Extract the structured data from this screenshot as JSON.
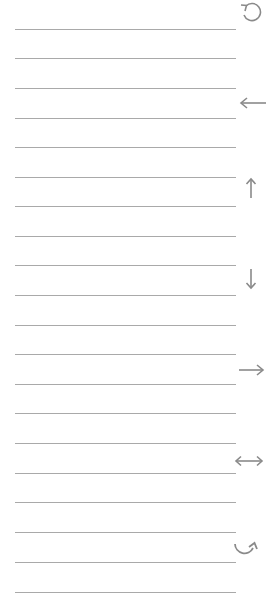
{
  "lines": {
    "count": 20,
    "color": "#a9a9a9",
    "positions_y": [
      29,
      58,
      88,
      118,
      147,
      177,
      206,
      236,
      265,
      295,
      325,
      354,
      384,
      413,
      443,
      473,
      502,
      532,
      562,
      592
    ]
  },
  "icons": [
    {
      "name": "rotate-counterclockwise-icon",
      "y": 1
    },
    {
      "name": "arrow-left-icon",
      "y": 92
    },
    {
      "name": "arrow-up-icon",
      "y": 177
    },
    {
      "name": "arrow-down-icon",
      "y": 268
    },
    {
      "name": "arrow-right-icon",
      "y": 359
    },
    {
      "name": "arrow-left-right-icon",
      "y": 450
    },
    {
      "name": "rotate-clockwise-icon",
      "y": 539
    }
  ],
  "icon_color": "#8a8a8a"
}
